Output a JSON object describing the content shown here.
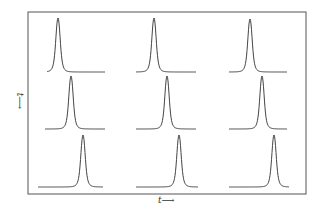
{
  "figure": {
    "xlabel": "t⟶",
    "ylabel": "t⟶",
    "frame": {
      "x": 28,
      "y": 12,
      "width": 278,
      "height": 182,
      "stroke": "#555555"
    },
    "curve_color": "#444444"
  },
  "chart_data": {
    "type": "line",
    "title": "",
    "xlabel": "t →",
    "ylabel": "t →",
    "grid": false,
    "layout": "3x3 grid of single-peak pulses",
    "panels": [
      {
        "row": 1,
        "col": 1,
        "x_start": 47,
        "x_end": 105,
        "peak_x": 58,
        "peak_y": 18,
        "baseline_y": 72
      },
      {
        "row": 1,
        "col": 2,
        "x_start": 136,
        "x_end": 196,
        "peak_x": 154,
        "peak_y": 18,
        "baseline_y": 72
      },
      {
        "row": 1,
        "col": 3,
        "x_start": 229,
        "x_end": 287,
        "peak_x": 250,
        "peak_y": 19,
        "baseline_y": 72
      },
      {
        "row": 2,
        "col": 1,
        "x_start": 45,
        "x_end": 105,
        "peak_x": 71,
        "peak_y": 76,
        "baseline_y": 129
      },
      {
        "row": 2,
        "col": 2,
        "x_start": 136,
        "x_end": 196,
        "peak_x": 167,
        "peak_y": 76,
        "baseline_y": 129
      },
      {
        "row": 2,
        "col": 3,
        "x_start": 229,
        "x_end": 287,
        "peak_x": 262,
        "peak_y": 76,
        "baseline_y": 129
      },
      {
        "row": 3,
        "col": 1,
        "x_start": 38,
        "x_end": 103,
        "peak_x": 83,
        "peak_y": 135,
        "baseline_y": 187
      },
      {
        "row": 3,
        "col": 2,
        "x_start": 136,
        "x_end": 198,
        "peak_x": 179,
        "peak_y": 135,
        "baseline_y": 187
      },
      {
        "row": 3,
        "col": 3,
        "x_start": 229,
        "x_end": 289,
        "peak_x": 274,
        "peak_y": 135,
        "baseline_y": 187
      }
    ]
  }
}
